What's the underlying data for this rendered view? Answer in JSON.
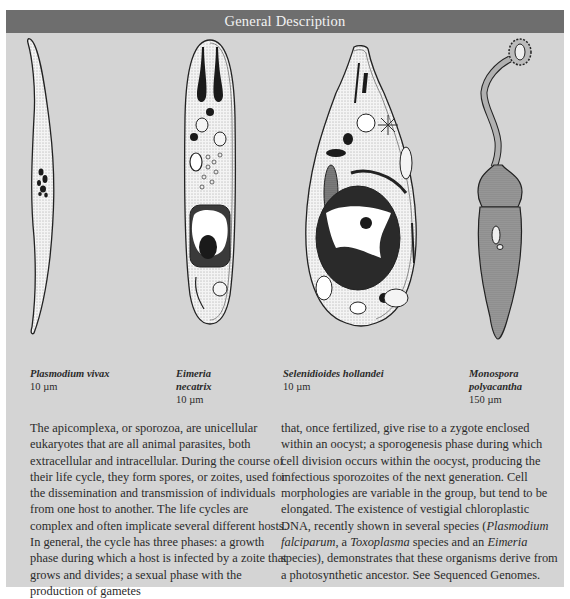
{
  "header": {
    "title": "General Description"
  },
  "colors": {
    "header_bg": "#6e6e6e",
    "header_text": "#f2f2f2",
    "panel_bg": "#d4d4d4",
    "body_text": "#2b2b2b"
  },
  "figures": [
    {
      "name": "Plasmodium vivax",
      "size": "10 µm",
      "icon": "plasmodium-cell-icon"
    },
    {
      "name_line1": "Eimeria",
      "name_line2": "necatrix",
      "size": "10 µm",
      "icon": "eimeria-cell-icon"
    },
    {
      "name": "Selenidioides hollandei",
      "size": "10 µm",
      "icon": "selenidioides-cell-icon"
    },
    {
      "name_line1": "Monospora",
      "name_line2": "polyacantha",
      "size": "150 µm",
      "icon": "monospora-cell-icon"
    }
  ],
  "body": {
    "left_column": "The apicomplexa, or sporozoa, are unicellular eukaryotes that are all animal parasites, both extracellular and intracellular. During the course of their life cycle, they form spores, or zoites, used for the dissemination and transmission of individuals from one host to another. The life cycles are complex and often implicate several different hosts. In general, the cycle has three phases: a growth phase during which a host is infected by a zoite that grows and divides; a sexual phase with the production of gametes",
    "right_column_part1": "that, once fertilized, give rise to a zygote enclosed within an oocyst; a sporogenesis phase during which cell division occurs within the oocyst, producing the infectious sporozoites of the next generation. Cell morphologies are variable in the group, but tend to be elongated. The existence of vestigial chloroplastic DNA, recently shown in several species (",
    "right_column_italic1": "Plasmodium falciparum",
    "right_column_part2": ", a ",
    "right_column_italic2": "Toxoplasma",
    "right_column_part3": " species and an ",
    "right_column_italic3": "Eimeria",
    "right_column_part4": " species), demonstrates that these organisms derive from a photosynthetic ancestor. See ",
    "right_column_link": "Sequenced Genomes",
    "right_column_end": "."
  }
}
